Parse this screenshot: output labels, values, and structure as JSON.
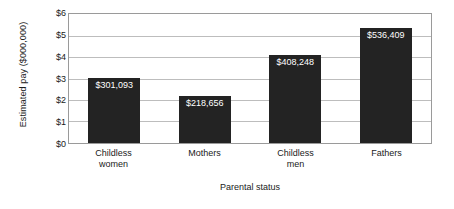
{
  "chart_data": {
    "type": "bar",
    "title": "",
    "xlabel": "Parental status",
    "ylabel": "Estimated pay ($000,000)",
    "ylabel_lines": [
      "Estimated pay",
      "($000,000)"
    ],
    "categories": [
      "Childless women",
      "Mothers",
      "Childless men",
      "Fathers"
    ],
    "category_lines": [
      [
        "Childless",
        "women"
      ],
      [
        "Mothers"
      ],
      [
        "Childless",
        "men"
      ],
      [
        "Fathers"
      ]
    ],
    "values": [
      301093,
      218656,
      408248,
      536409
    ],
    "value_labels": [
      "$301,093",
      "$218,656",
      "$408,248",
      "$536,409"
    ],
    "plot_values_millions": [
      3.01093,
      2.18656,
      4.08248,
      5.36409
    ],
    "ylim": [
      0,
      6
    ],
    "ytick_values": [
      0,
      1,
      2,
      3,
      4,
      5,
      6
    ],
    "ytick_labels": [
      "$0",
      "$1",
      "$2",
      "$3",
      "$4",
      "$5",
      "$6"
    ],
    "grid": true,
    "grid_axis": "y",
    "legend": false,
    "legend_position": "none",
    "colors": {
      "bar_fill": "#232323",
      "bar_value_text": "#ffffff",
      "gridline": "#bdbdbd",
      "axis_border": "#9a9a9a",
      "background": "#ffffff",
      "text": "#1a1a1a"
    }
  }
}
